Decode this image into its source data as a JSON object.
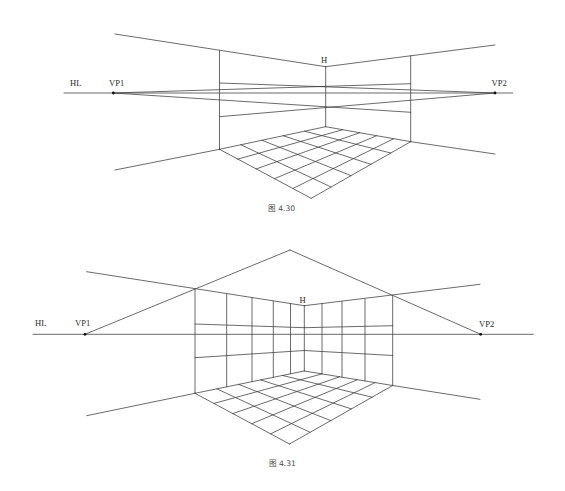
{
  "figures": [
    {
      "id": "fig-4-30",
      "caption": "图 4.30",
      "caption_pos": [
        281.5,
        211
      ],
      "labels": [
        {
          "name": "horizon-line-label",
          "text": "HL",
          "x": 70,
          "y": 86
        },
        {
          "name": "vp1-label",
          "text": "VP1",
          "x": 109,
          "y": 86
        },
        {
          "name": "vp2-label",
          "text": "VP2",
          "x": 491.5,
          "y": 86
        },
        {
          "name": "h-label",
          "text": "H",
          "x": 321,
          "y": 63
        }
      ],
      "vanishing_points": [
        {
          "name": "vp1-point",
          "x": 113.3,
          "y": 93
        },
        {
          "name": "vp2-point",
          "x": 495,
          "y": 93
        }
      ],
      "lines": [
        {
          "name": "horizon-line",
          "p": [
            64,
            93,
            512.7,
            93
          ]
        },
        {
          "name": "ceiling-left-edge",
          "p": [
            115,
            34,
            325.7,
            66.7
          ]
        },
        {
          "name": "ceiling-right-edge",
          "p": [
            325.7,
            66.7,
            495,
            45
          ]
        },
        {
          "name": "left-wall-corner",
          "p": [
            219.5,
            50.7,
            219.5,
            149.3
          ]
        },
        {
          "name": "center-corner",
          "p": [
            325.7,
            66.7,
            325.7,
            126.7
          ]
        },
        {
          "name": "right-wall-corner",
          "p": [
            410.7,
            55.7,
            410.7,
            141.7
          ]
        },
        {
          "name": "floor-left-extension",
          "p": [
            115,
            170,
            219.5,
            149.3
          ]
        },
        {
          "name": "floor-right-extension",
          "p": [
            410.7,
            141.7,
            495,
            154
          ]
        },
        {
          "name": "vp2-guide-upper",
          "p": [
            495,
            93,
            219.5,
            83
          ]
        },
        {
          "name": "vp2-guide-lower",
          "p": [
            495,
            93,
            219.5,
            116.7
          ]
        },
        {
          "name": "vp1-guide-upper",
          "p": [
            113.3,
            93,
            410.7,
            83.7
          ]
        },
        {
          "name": "vp1-guide-lower",
          "p": [
            113.3,
            93,
            410.7,
            112.3
          ]
        }
      ],
      "floor": {
        "divisions": 5,
        "back": [
          325.7,
          126.7
        ],
        "left": [
          219.5,
          149.3
        ],
        "right": [
          410.7,
          141.7
        ],
        "front": [
          311.2,
          198.3
        ]
      },
      "walls": null
    },
    {
      "id": "fig-4-31",
      "caption": "图 4.31",
      "caption_pos": [
        282.3,
        466.3
      ],
      "labels": [
        {
          "name": "horizon-line-label",
          "text": "HL",
          "x": 35,
          "y": 326
        },
        {
          "name": "vp1-label",
          "text": "VP1",
          "x": 75,
          "y": 326
        },
        {
          "name": "vp2-label",
          "text": "VP2",
          "x": 479,
          "y": 327
        },
        {
          "name": "h-label",
          "text": "H",
          "x": 299.5,
          "y": 302.5
        }
      ],
      "vanishing_points": [
        {
          "name": "vp1-point",
          "x": 85,
          "y": 334.3
        },
        {
          "name": "vp2-point",
          "x": 480.7,
          "y": 334.3
        }
      ],
      "lines": [
        {
          "name": "horizon-line",
          "p": [
            33,
            334.3,
            533.3,
            334.3
          ]
        },
        {
          "name": "vp1-to-apex",
          "p": [
            85,
            334.3,
            290,
            250
          ]
        },
        {
          "name": "apex-to-vp2",
          "p": [
            290,
            250,
            480.7,
            334.3
          ]
        },
        {
          "name": "ceiling-left-edge",
          "p": [
            86.7,
            271.7,
            304.3,
            305.7
          ]
        },
        {
          "name": "ceiling-right-edge",
          "p": [
            304.3,
            305.7,
            480,
            284.3
          ]
        },
        {
          "name": "left-wall-corner",
          "p": [
            195,
            289.3,
            195,
            393.3
          ]
        },
        {
          "name": "center-corner",
          "p": [
            304.3,
            305.7,
            304.3,
            371
          ]
        },
        {
          "name": "right-wall-corner",
          "p": [
            392.7,
            296,
            392.7,
            385.5
          ]
        },
        {
          "name": "floor-left-extension",
          "p": [
            86.7,
            415.7,
            195,
            393.3
          ]
        },
        {
          "name": "floor-right-extension",
          "p": [
            392.7,
            385.5,
            480,
            399.3
          ]
        },
        {
          "name": "left-wall-horizontal-upper",
          "p": [
            195,
            324,
            304.3,
            327.7
          ]
        },
        {
          "name": "left-wall-horizontal-lower",
          "p": [
            195,
            357.7,
            304.3,
            350.5
          ]
        },
        {
          "name": "right-wall-horizontal-upper",
          "p": [
            304.3,
            327.7,
            392.7,
            325.7
          ]
        },
        {
          "name": "right-wall-horizontal-lower",
          "p": [
            304.3,
            350.5,
            392.7,
            355.5
          ]
        }
      ],
      "floor": {
        "divisions": 5,
        "back": [
          304.3,
          371
        ],
        "left": [
          195,
          393.3
        ],
        "right": [
          392.7,
          385.5
        ],
        "front": [
          289.5,
          444
        ]
      },
      "walls": {
        "left_verticals_x": [
          226.7,
          252,
          273.3,
          290.5
        ],
        "left_top": [
          195,
          289.3,
          304.3,
          305.7
        ],
        "left_bottom": [
          195,
          393.3,
          304.3,
          371
        ],
        "right_verticals_x": [
          322,
          342,
          365
        ],
        "right_top": [
          304.3,
          305.7,
          392.7,
          296
        ],
        "right_bottom": [
          304.3,
          371,
          392.7,
          385.5
        ]
      }
    }
  ]
}
